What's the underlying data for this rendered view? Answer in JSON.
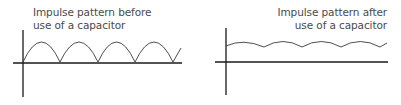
{
  "diagrams": {
    "left": {
      "label_line1": "Impulse pattern before",
      "label_line2": "use of a capacitor",
      "waveform": "full-wave rectified pulses"
    },
    "right": {
      "label_line1": "Impulse pattern after",
      "label_line2": "use of a capacitor",
      "waveform": "smoothed ripple voltage"
    }
  },
  "colors": {
    "axis": "#1a1a1a",
    "wave": "#3a3a3a",
    "text": "#4a4a4a"
  }
}
